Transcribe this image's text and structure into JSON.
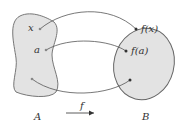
{
  "diagram": {
    "domain_label": "A",
    "codomain_label": "B",
    "function_label": "f",
    "domain_points": [
      "x",
      "a",
      ""
    ],
    "codomain_points": [
      "f(x)",
      "f(a)",
      ""
    ],
    "colors": {
      "fill": "#e3e3e3",
      "stroke": "#666666",
      "arrow": "#555555"
    }
  }
}
